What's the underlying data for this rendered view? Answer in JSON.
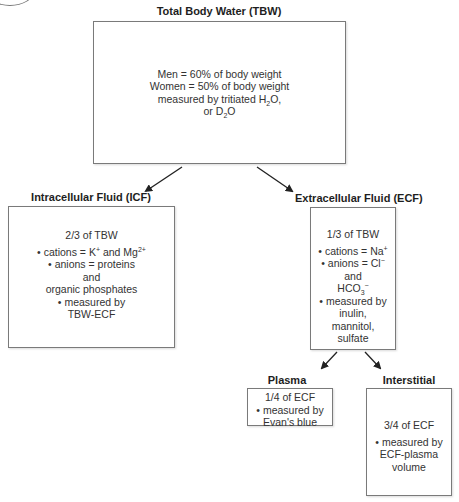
{
  "tbw": {
    "title": "Total Body Water (TBW)",
    "lines": [
      "Men = 60% of body weight",
      "Women = 50% of body weight",
      "measured by tritiated H",
      "2",
      "O,",
      "or D",
      "2",
      "O"
    ]
  },
  "icf": {
    "title": "Intracellular Fluid (ICF)",
    "fraction": "2/3 of TBW",
    "cations_prefix": "• cations = K",
    "cations_k_charge": "+",
    "cations_mid": " and Mg",
    "cations_mg_charge": "2+",
    "anions": "• anions = proteins",
    "and": "and",
    "organic": "organic phosphates",
    "measured": "• measured by",
    "method": "TBW-ECF"
  },
  "ecf": {
    "title": "Extracellular Fluid (ECF)",
    "fraction": "1/3 of TBW",
    "cations_prefix": "• cations = Na",
    "cations_charge": "+",
    "anions_prefix": "• anions = Cl",
    "anions_charge": "−",
    "and": "and",
    "hco_prefix": "HCO",
    "hco_sub": "3",
    "hco_charge": "−",
    "measured": "• measured by",
    "method_1": "inulin,",
    "method_2": "mannitol,",
    "method_3": "sulfate"
  },
  "plasma": {
    "title": "Plasma",
    "fraction": "1/4 of ECF",
    "measured": "• measured by",
    "method": "Evan's blue"
  },
  "interstitial": {
    "title": "Interstitial",
    "fraction": "3/4 of ECF",
    "measured": "• measured by",
    "method_1": "ECF-plasma",
    "method_2": "volume"
  }
}
